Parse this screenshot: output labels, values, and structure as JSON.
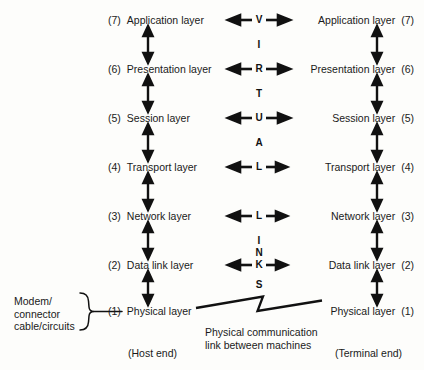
{
  "diagram": {
    "host_end_label": "(Host end)",
    "terminal_end_label": "(Terminal end)",
    "left_annotation": "Modem/\nconnector\ncable/circuits",
    "link_annotation": "Physical communication\nlink between machines",
    "stroke_color": "#111111",
    "background_color": "#fdfdfb"
  },
  "layers": [
    {
      "num": "(7)",
      "name": "Application layer",
      "right_num": "(7)",
      "y": 20,
      "virtual_link": true,
      "mid_letter": "V"
    },
    {
      "num": "(6)",
      "name": "Presentation layer",
      "right_num": "(6)",
      "y": 69,
      "virtual_link": true,
      "mid_letter": "R"
    },
    {
      "num": "(5)",
      "name": "Session layer",
      "right_num": "(5)",
      "y": 118,
      "virtual_link": true,
      "mid_letter": "U"
    },
    {
      "num": "(4)",
      "name": "Transport layer",
      "right_num": "(4)",
      "y": 167,
      "virtual_link": true,
      "mid_letter": "L"
    },
    {
      "num": "(3)",
      "name": "Network layer",
      "right_num": "(3)",
      "y": 216,
      "virtual_link": true,
      "mid_letter": "L"
    },
    {
      "num": "(2)",
      "name": "Data link layer",
      "right_num": "(2)",
      "y": 265,
      "virtual_link": true,
      "mid_letter": "K"
    },
    {
      "num": "(1)",
      "name": "Physical layer",
      "right_num": "(1)",
      "y": 311,
      "virtual_link": false,
      "mid_letter": ""
    }
  ],
  "middle_column": {
    "word": "VIRTUAL LINKS",
    "spacer_letters": [
      {
        "char": "I",
        "y": 45
      },
      {
        "char": "T",
        "y": 94
      },
      {
        "char": "A",
        "y": 143
      },
      {
        "char": "I",
        "y": 241
      },
      {
        "char": "N",
        "y": 253
      },
      {
        "char": "S",
        "y": 285
      }
    ]
  }
}
